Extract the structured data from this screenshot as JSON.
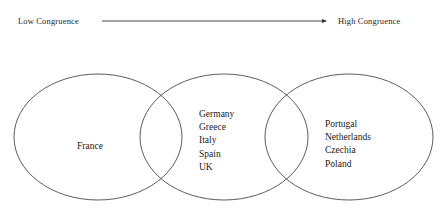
{
  "figure": {
    "background_color": "#ffffff",
    "stroke_color": "#4a4a4a",
    "text_color": "#1a1a1a"
  },
  "continuum": {
    "low_label": "Low Congruence",
    "high_label": "High Congruence",
    "arrow_direction": "left-to-right",
    "arrow_icon": "right-arrow-icon"
  },
  "groups": [
    {
      "id": "group-1",
      "position": "left",
      "members": [
        "France"
      ]
    },
    {
      "id": "group-2",
      "position": "middle",
      "members": [
        "Germany",
        "Greece",
        "Italy",
        "Spain",
        "UK"
      ]
    },
    {
      "id": "group-3",
      "position": "right",
      "members": [
        "Portugal",
        "Netherlands",
        "Czechia",
        "Poland"
      ]
    }
  ]
}
